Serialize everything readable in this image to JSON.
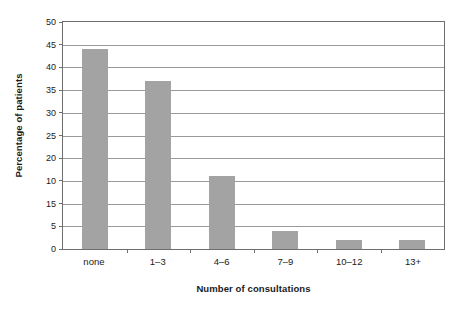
{
  "chart_data": {
    "type": "bar",
    "title": "",
    "xlabel": "Number of consultations",
    "ylabel": "Percentage of patients",
    "categories": [
      "none",
      "1–3",
      "4–6",
      "7–9",
      "10–12",
      "13+"
    ],
    "values": [
      44,
      37,
      16,
      4,
      2,
      2
    ],
    "ylim": [
      0,
      50
    ],
    "ytick_labels": [
      "50",
      "45",
      "40",
      "35",
      "30",
      "25",
      "20",
      "10",
      "15",
      "5",
      "0"
    ],
    "yticks": [
      50,
      45,
      40,
      35,
      30,
      25,
      20,
      15,
      10,
      5,
      0
    ],
    "grid": "horizontal",
    "legend": "none",
    "bar_color": "#a3a3a3",
    "axis_color": "#6e6e6e",
    "gridline_color": "#9a9a9a",
    "background_color": "#ffffff"
  }
}
